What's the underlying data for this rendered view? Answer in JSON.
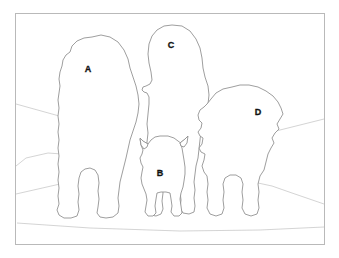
{
  "figure": {
    "kind": "outline-illustration",
    "caption_text": "",
    "canvas": {
      "width": 339,
      "height": 258
    },
    "background_color": "#ffffff",
    "frame": {
      "name": "image-border",
      "x": 15,
      "y": 13,
      "width": 310,
      "height": 232,
      "stroke_color": "#b9b9b9"
    },
    "line_colors": {
      "outline": "#8d8d8d",
      "scene": "#c9c9c9",
      "frame": "#b9b9b9",
      "label": "#111111"
    },
    "subjects": [
      {
        "id": "A",
        "label": "A",
        "name": "subject-outline-a",
        "description": "large shaggy dog, left, facing viewer",
        "label_x": 88,
        "label_y": 69
      },
      {
        "id": "B",
        "label": "B",
        "name": "subject-outline-b",
        "description": "small dog with pointed ears, center front",
        "label_x": 160,
        "label_y": 173
      },
      {
        "id": "C",
        "label": "C",
        "name": "subject-outline-c",
        "description": "tall shaggy dog, center rear",
        "label_x": 171,
        "label_y": 45
      },
      {
        "id": "D",
        "label": "D",
        "name": "subject-outline-d",
        "description": "medium shaggy dog, right",
        "label_x": 258,
        "label_y": 112
      }
    ],
    "scene_elements": [
      {
        "name": "horizon-line-left",
        "description": "faint diagonal horizon rising to the right from the left border"
      },
      {
        "name": "boulder-outline-left",
        "description": "faint rock ledge in lower left"
      },
      {
        "name": "ground-line-left",
        "description": "faint path edge crossing lower left"
      },
      {
        "name": "horizon-line-right",
        "description": "faint diagonal horizon descending to the right border"
      },
      {
        "name": "ground-line-right",
        "description": "faint path edge crossing lower right"
      },
      {
        "name": "foreground-ground-line",
        "description": "faint near-horizontal ground line across the bottom"
      }
    ]
  }
}
